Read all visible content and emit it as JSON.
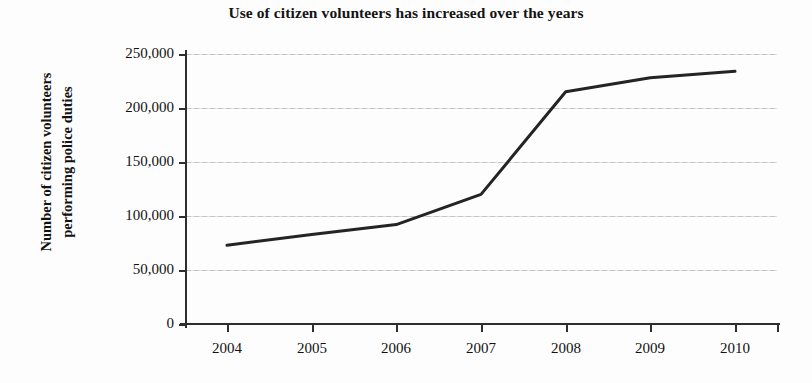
{
  "chart_data": {
    "type": "line",
    "title": "Use of citizen volunteers has increased over the years",
    "xlabel": "",
    "ylabel": "Number of citizen volunteers performing police duties",
    "ylabel_line1": "Number of citizen volunteers",
    "ylabel_line2": "performing police duties",
    "categories": [
      "2004",
      "2005",
      "2006",
      "2007",
      "2008",
      "2009",
      "2010"
    ],
    "x": [
      2004,
      2005,
      2006,
      2007,
      2008,
      2009,
      2010
    ],
    "values": [
      73000,
      83000,
      92000,
      120000,
      215000,
      228000,
      234000
    ],
    "series": [
      {
        "name": "Citizen volunteers performing police duties",
        "values": [
          73000,
          83000,
          92000,
          120000,
          215000,
          228000,
          234000
        ]
      }
    ],
    "ylim": [
      0,
      250000
    ],
    "ytick_values": [
      0,
      50000,
      100000,
      150000,
      200000,
      250000
    ],
    "ytick_labels": [
      "0",
      "50,000",
      "100,000",
      "150,000",
      "200,000",
      "250,000"
    ],
    "xtick_labels": [
      "2004",
      "2005",
      "2006",
      "2007",
      "2008",
      "2009",
      "2010"
    ],
    "grid": true,
    "grid_axis": "y",
    "legend": false,
    "legend_position": "none",
    "line_color": "#242424",
    "grid_color": "#b9b9b9",
    "axis_color": "#2e2e2e",
    "background_color": "#fdfdfd",
    "annotations": []
  }
}
